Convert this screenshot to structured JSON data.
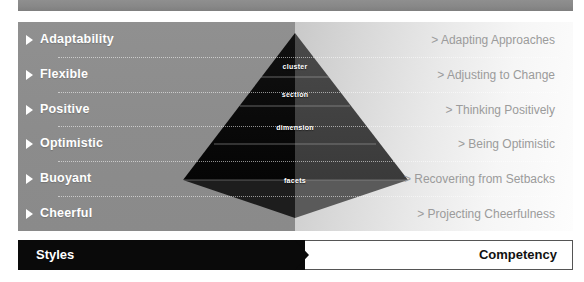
{
  "panel": {
    "split_x_pct": 50,
    "left_bg_color": "#8c8c8c",
    "right_bg_color": "#f2f2f2"
  },
  "rows": [
    {
      "style": "Adaptability",
      "competency": "> Adapting Approaches"
    },
    {
      "style": "Flexible",
      "competency": "> Adjusting to Change"
    },
    {
      "style": "Positive",
      "competency": "> Thinking Positively"
    },
    {
      "style": "Optimistic",
      "competency": "> Being Optimistic"
    },
    {
      "style": "Buoyant",
      "competency": "> Recovering from Setbacks"
    },
    {
      "style": "Cheerful",
      "competency": "> Projecting Cheerfulness"
    }
  ],
  "pyramid": {
    "levels": [
      {
        "label": "cluster"
      },
      {
        "label": "section"
      },
      {
        "label": "dimension"
      },
      {
        "label": "facets"
      }
    ]
  },
  "footer": {
    "styles_label": "Styles",
    "competency_label": "Competency",
    "styles_bg": "#0a0a0a",
    "competency_bg": "#ffffff"
  }
}
